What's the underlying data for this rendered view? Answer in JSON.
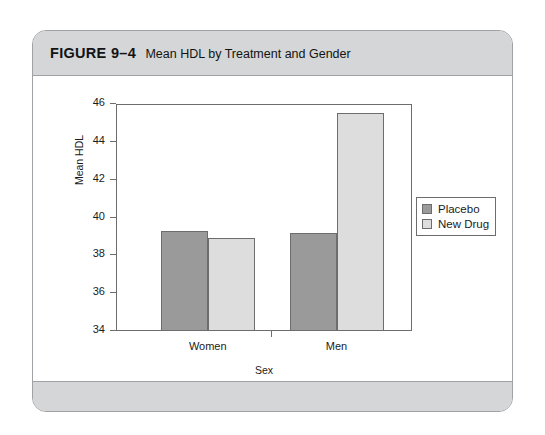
{
  "figure": {
    "number_label": "FIGURE 9–4",
    "caption": "Mean HDL by Treatment and Gender"
  },
  "chart_data": {
    "type": "bar",
    "title": "Mean HDL by Treatment and Gender",
    "xlabel": "Sex",
    "ylabel": "Mean HDL",
    "categories": [
      "Women",
      "Men"
    ],
    "series": [
      {
        "name": "Placebo",
        "color": "#9a9a9a",
        "values": [
          39.3,
          39.2
        ]
      },
      {
        "name": "New Drug",
        "color": "#dddddd",
        "values": [
          38.9,
          45.5
        ]
      }
    ],
    "ylim": [
      34,
      46
    ],
    "yticks": [
      46,
      44,
      42,
      40,
      38,
      36,
      34
    ],
    "ytick_labels": [
      "46",
      "44",
      "42",
      "40",
      "38",
      "36",
      "34"
    ],
    "grid": false,
    "legend_position": "right-outside",
    "legend_entries": [
      "Placebo",
      "New Drug"
    ]
  },
  "colors": {
    "card_band": "#d4d6d7",
    "card_border": "#9fa3a6",
    "axis": "#6d6d6d",
    "placebo": "#9a9a9a",
    "new_drug": "#dddddd"
  }
}
